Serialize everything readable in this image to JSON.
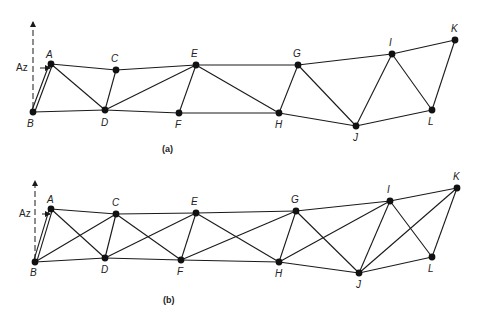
{
  "figures": [
    {
      "id": "a",
      "caption": "(a)",
      "caption_pos": [
        162,
        152
      ],
      "az_label": "Az",
      "az_label_pos": [
        16,
        71
      ],
      "axis": {
        "x": 33,
        "y_top": 22,
        "y_bottom": 108
      },
      "arrow": {
        "x1": 40,
        "y1": 68,
        "x2": 50,
        "y2": 68
      },
      "nodes": [
        {
          "id": "A",
          "x": 51,
          "y": 64,
          "lx": 46,
          "ly": 58
        },
        {
          "id": "B",
          "x": 33,
          "y": 112,
          "lx": 27,
          "ly": 127
        },
        {
          "id": "C",
          "x": 116,
          "y": 70,
          "lx": 111,
          "ly": 62
        },
        {
          "id": "D",
          "x": 105,
          "y": 110,
          "lx": 101,
          "ly": 126
        },
        {
          "id": "E",
          "x": 196,
          "y": 65,
          "lx": 191,
          "ly": 57
        },
        {
          "id": "F",
          "x": 179,
          "y": 113,
          "lx": 175,
          "ly": 128
        },
        {
          "id": "G",
          "x": 298,
          "y": 65,
          "lx": 293,
          "ly": 57
        },
        {
          "id": "H",
          "x": 279,
          "y": 113,
          "lx": 275,
          "ly": 128
        },
        {
          "id": "I",
          "x": 392,
          "y": 54,
          "lx": 389,
          "ly": 46
        },
        {
          "id": "J",
          "x": 356,
          "y": 126,
          "lx": 353,
          "ly": 141
        },
        {
          "id": "K",
          "x": 455,
          "y": 40,
          "lx": 451,
          "ly": 32
        },
        {
          "id": "L",
          "x": 432,
          "y": 110,
          "lx": 428,
          "ly": 125
        }
      ],
      "double_members": [
        [
          "A",
          "B"
        ]
      ],
      "members": [
        [
          "A",
          "C"
        ],
        [
          "C",
          "E"
        ],
        [
          "E",
          "G"
        ],
        [
          "G",
          "I"
        ],
        [
          "I",
          "K"
        ],
        [
          "B",
          "D"
        ],
        [
          "D",
          "F"
        ],
        [
          "F",
          "H"
        ],
        [
          "H",
          "J"
        ],
        [
          "J",
          "L"
        ],
        [
          "A",
          "D"
        ],
        [
          "C",
          "D"
        ],
        [
          "D",
          "E"
        ],
        [
          "E",
          "F"
        ],
        [
          "E",
          "H"
        ],
        [
          "G",
          "H"
        ],
        [
          "G",
          "J"
        ],
        [
          "I",
          "J"
        ],
        [
          "I",
          "L"
        ],
        [
          "K",
          "L"
        ]
      ]
    },
    {
      "id": "b",
      "caption": "(b)",
      "caption_pos": [
        163,
        303
      ],
      "az_label": "Az",
      "az_label_pos": [
        19,
        217
      ],
      "axis": {
        "x": 35,
        "y_top": 181,
        "y_bottom": 260
      },
      "arrow": {
        "x1": 42,
        "y1": 214,
        "x2": 50,
        "y2": 214
      },
      "nodes": [
        {
          "id": "A",
          "x": 51,
          "y": 209,
          "lx": 47,
          "ly": 203
        },
        {
          "id": "B",
          "x": 35,
          "y": 262,
          "lx": 30,
          "ly": 276
        },
        {
          "id": "C",
          "x": 116,
          "y": 214,
          "lx": 112,
          "ly": 206
        },
        {
          "id": "D",
          "x": 105,
          "y": 258,
          "lx": 101,
          "ly": 273
        },
        {
          "id": "E",
          "x": 196,
          "y": 213,
          "lx": 191,
          "ly": 205
        },
        {
          "id": "F",
          "x": 181,
          "y": 260,
          "lx": 177,
          "ly": 275
        },
        {
          "id": "G",
          "x": 296,
          "y": 211,
          "lx": 291,
          "ly": 203
        },
        {
          "id": "H",
          "x": 279,
          "y": 262,
          "lx": 275,
          "ly": 277
        },
        {
          "id": "I",
          "x": 390,
          "y": 201,
          "lx": 387,
          "ly": 193
        },
        {
          "id": "J",
          "x": 359,
          "y": 273,
          "lx": 356,
          "ly": 288
        },
        {
          "id": "K",
          "x": 457,
          "y": 188,
          "lx": 453,
          "ly": 180
        },
        {
          "id": "L",
          "x": 432,
          "y": 257,
          "lx": 428,
          "ly": 272
        }
      ],
      "double_members": [
        [
          "A",
          "B"
        ]
      ],
      "members": [
        [
          "A",
          "C"
        ],
        [
          "C",
          "E"
        ],
        [
          "E",
          "G"
        ],
        [
          "G",
          "I"
        ],
        [
          "I",
          "K"
        ],
        [
          "B",
          "D"
        ],
        [
          "D",
          "F"
        ],
        [
          "F",
          "H"
        ],
        [
          "H",
          "J"
        ],
        [
          "J",
          "L"
        ],
        [
          "A",
          "D"
        ],
        [
          "B",
          "C"
        ],
        [
          "C",
          "D"
        ],
        [
          "C",
          "F"
        ],
        [
          "D",
          "E"
        ],
        [
          "E",
          "F"
        ],
        [
          "E",
          "H"
        ],
        [
          "F",
          "G"
        ],
        [
          "G",
          "H"
        ],
        [
          "G",
          "J"
        ],
        [
          "H",
          "I"
        ],
        [
          "I",
          "J"
        ],
        [
          "I",
          "L"
        ],
        [
          "J",
          "K"
        ],
        [
          "K",
          "L"
        ]
      ]
    }
  ]
}
